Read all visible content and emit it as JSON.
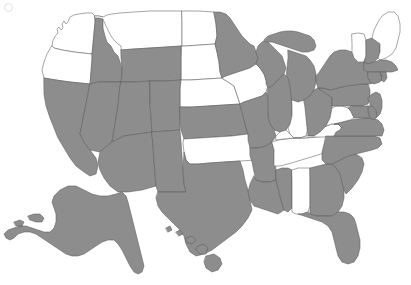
{
  "map": {
    "title": "United States Choropleth Map",
    "projection": "albers-usa",
    "legend_visible": false,
    "background_color": "#ffffff",
    "selected_color": "#8d8d8d",
    "unselected_color": "#ffffff",
    "border_color": "#5c5c5c",
    "selected_count": 35,
    "unselected_count": 16,
    "insets": [
      "Alaska",
      "Hawaii"
    ]
  },
  "chart_data": {
    "type": "map",
    "xlabel": "",
    "ylabel": "",
    "categories": [
      "Alabama",
      "Alaska",
      "Arizona",
      "Arkansas",
      "California",
      "Colorado",
      "Connecticut",
      "Delaware",
      "Florida",
      "Georgia",
      "Hawaii",
      "Idaho",
      "Illinois",
      "Indiana",
      "Iowa",
      "Kansas",
      "Kentucky",
      "Louisiana",
      "Maine",
      "Maryland",
      "Massachusetts",
      "Michigan",
      "Minnesota",
      "Mississippi",
      "Missouri",
      "Montana",
      "Nebraska",
      "Nevada",
      "New Hampshire",
      "New Jersey",
      "New Mexico",
      "New York",
      "North Carolina",
      "North Dakota",
      "Ohio",
      "Oklahoma",
      "Oregon",
      "Pennsylvania",
      "Rhode Island",
      "South Carolina",
      "South Dakota",
      "Tennessee",
      "Texas",
      "Utah",
      "Vermont",
      "Virginia",
      "Washington",
      "West Virginia",
      "Wisconsin",
      "Wyoming"
    ],
    "values": [
      0,
      1,
      1,
      1,
      1,
      1,
      1,
      1,
      1,
      1,
      1,
      1,
      1,
      0,
      0,
      1,
      0,
      1,
      0,
      1,
      1,
      1,
      1,
      1,
      1,
      0,
      0,
      1,
      1,
      1,
      1,
      1,
      1,
      0,
      1,
      0,
      0,
      1,
      1,
      1,
      0,
      0,
      1,
      1,
      0,
      1,
      0,
      0,
      1,
      1
    ],
    "value_labels": {
      "0": "Unselected",
      "1": "Selected"
    },
    "legend": [
      "Selected",
      "Unselected"
    ],
    "legend_position": "none",
    "grid": false
  },
  "states": {
    "AL": {
      "name": "Alabama",
      "selected": false
    },
    "AK": {
      "name": "Alaska",
      "selected": true
    },
    "AZ": {
      "name": "Arizona",
      "selected": true
    },
    "AR": {
      "name": "Arkansas",
      "selected": true
    },
    "CA": {
      "name": "California",
      "selected": true
    },
    "CO": {
      "name": "Colorado",
      "selected": true
    },
    "CT": {
      "name": "Connecticut",
      "selected": true
    },
    "DE": {
      "name": "Delaware",
      "selected": true
    },
    "FL": {
      "name": "Florida",
      "selected": true
    },
    "GA": {
      "name": "Georgia",
      "selected": true
    },
    "HI": {
      "name": "Hawaii",
      "selected": true
    },
    "ID": {
      "name": "Idaho",
      "selected": true
    },
    "IL": {
      "name": "Illinois",
      "selected": true
    },
    "IN": {
      "name": "Indiana",
      "selected": false
    },
    "IA": {
      "name": "Iowa",
      "selected": false
    },
    "KS": {
      "name": "Kansas",
      "selected": true
    },
    "KY": {
      "name": "Kentucky",
      "selected": false
    },
    "LA": {
      "name": "Louisiana",
      "selected": true
    },
    "ME": {
      "name": "Maine",
      "selected": false
    },
    "MD": {
      "name": "Maryland",
      "selected": true
    },
    "MA": {
      "name": "Massachusetts",
      "selected": true
    },
    "MI": {
      "name": "Michigan",
      "selected": true
    },
    "MN": {
      "name": "Minnesota",
      "selected": true
    },
    "MS": {
      "name": "Mississippi",
      "selected": true
    },
    "MO": {
      "name": "Missouri",
      "selected": true
    },
    "MT": {
      "name": "Montana",
      "selected": false
    },
    "NE": {
      "name": "Nebraska",
      "selected": false
    },
    "NV": {
      "name": "Nevada",
      "selected": true
    },
    "NH": {
      "name": "New Hampshire",
      "selected": true
    },
    "NJ": {
      "name": "New Jersey",
      "selected": true
    },
    "NM": {
      "name": "New Mexico",
      "selected": true
    },
    "NY": {
      "name": "New York",
      "selected": true
    },
    "NC": {
      "name": "North Carolina",
      "selected": true
    },
    "ND": {
      "name": "North Dakota",
      "selected": false
    },
    "OH": {
      "name": "Ohio",
      "selected": true
    },
    "OK": {
      "name": "Oklahoma",
      "selected": false
    },
    "OR": {
      "name": "Oregon",
      "selected": false
    },
    "PA": {
      "name": "Pennsylvania",
      "selected": true
    },
    "RI": {
      "name": "Rhode Island",
      "selected": true
    },
    "SC": {
      "name": "South Carolina",
      "selected": true
    },
    "SD": {
      "name": "South Dakota",
      "selected": false
    },
    "TN": {
      "name": "Tennessee",
      "selected": false
    },
    "TX": {
      "name": "Texas",
      "selected": true
    },
    "UT": {
      "name": "Utah",
      "selected": true
    },
    "VT": {
      "name": "Vermont",
      "selected": false
    },
    "VA": {
      "name": "Virginia",
      "selected": true
    },
    "WA": {
      "name": "Washington",
      "selected": false
    },
    "WV": {
      "name": "West Virginia",
      "selected": false
    },
    "WI": {
      "name": "Wisconsin",
      "selected": true
    },
    "WY": {
      "name": "Wyoming",
      "selected": true
    }
  }
}
